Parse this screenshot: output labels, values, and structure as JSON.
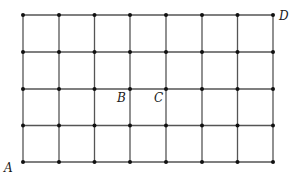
{
  "diagram": {
    "type": "lattice-grid",
    "columns": 7,
    "rows": 4,
    "x_lines": [
      23,
      59,
      94.5,
      130,
      166,
      202,
      237.5,
      273
    ],
    "y_lines": [
      15,
      52,
      89,
      125.5,
      162
    ],
    "line_color": "#555555",
    "dot_color": "#111111",
    "labels": [
      {
        "id": "A",
        "text": "A",
        "point": [
          0,
          0
        ],
        "x": 4,
        "y": 172
      },
      {
        "id": "B",
        "text": "B",
        "point": [
          3,
          2
        ],
        "x": 117,
        "y": 102
      },
      {
        "id": "C",
        "text": "C",
        "point": [
          4,
          2
        ],
        "x": 154,
        "y": 102
      },
      {
        "id": "D",
        "text": "D",
        "point": [
          7,
          4
        ],
        "x": 279,
        "y": 20
      }
    ]
  }
}
